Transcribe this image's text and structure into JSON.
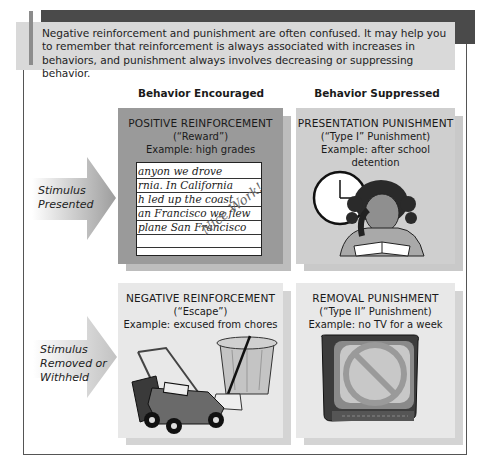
{
  "note": {
    "text": "Negative reinforcement and punishment are often confused. It may help you to remember that reinforcement is always associated with increases in behaviors, and punishment always involves decreasing or suppressing behavior."
  },
  "columns": {
    "encouraged": "Behavior Encouraged",
    "suppressed": "Behavior Suppressed"
  },
  "rows": {
    "presented": "Stimulus Presented",
    "removed": "Stimulus Removed or Withheld"
  },
  "cells": {
    "positive_reinforcement": {
      "title": "POSITIVE REINFORCEMENT",
      "subtitle": "(“Reward”)",
      "example": "Example: high grades",
      "illustration": "graded-handwritten-paper",
      "paper_lines": [
        "anyon we drove",
        "rnia. In California",
        "h led up the coast",
        "an Francisco we flew",
        "plane San Francisco"
      ],
      "annotation": "Nice Work!"
    },
    "presentation_punishment": {
      "title": "PRESENTATION PUNISHMENT",
      "subtitle": "(“Type I” Punishment)",
      "example": "Example: after school detention",
      "illustration": "girl-studying-with-clock"
    },
    "negative_reinforcement": {
      "title": "NEGATIVE REINFORCEMENT",
      "subtitle": "(“Escape”)",
      "example": "Example: excused from chores",
      "illustration": "lawnmower-trash-can-broom"
    },
    "removal_punishment": {
      "title": "REMOVAL PUNISHMENT",
      "subtitle": "(“Type II” Punishment)",
      "example": "Example: no TV for a week",
      "illustration": "tv-with-prohibition-sign"
    }
  },
  "colors": {
    "header_bar": "#4a4a4a",
    "note_bg": "#d9d9d9",
    "positive_reinforcement_bg": "#9a9a9a",
    "presentation_punishment_bg": "#cfcfcf",
    "bottom_boxes_bg": "#e8e8e8"
  }
}
